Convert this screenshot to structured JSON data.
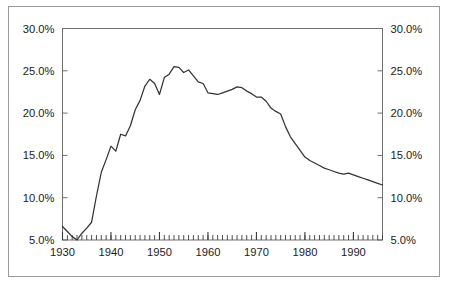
{
  "chart_data": {
    "type": "line",
    "title": "",
    "subtitle": "",
    "xlabel": "",
    "ylabel": "",
    "xlim": [
      1930,
      1996
    ],
    "ylim": [
      5.0,
      30.0
    ],
    "grid": false,
    "legend": null,
    "legend_position": "none",
    "y_tick_labels": [
      "30.0%",
      "25.0%",
      "20.0%",
      "15.0%",
      "10.0%",
      "5.0%"
    ],
    "y_tick_values": [
      30.0,
      25.0,
      20.0,
      15.0,
      10.0,
      5.0
    ],
    "y_axis_right_tick_labels": [
      "30.0%",
      "25.0%",
      "20.0%",
      "15.0%",
      "10.0%",
      "5.0%"
    ],
    "x_tick_labels": [
      "1930",
      "1940",
      "1950",
      "1960",
      "1970",
      "1980",
      "1990"
    ],
    "x_tick_values": [
      1930,
      1940,
      1950,
      1960,
      1970,
      1980,
      1990
    ],
    "x_minor_tick_interval": 1,
    "line_color": "#333333",
    "frame_color": "#9a9a9a",
    "background_color": "#ffffff",
    "series": [
      {
        "name": "value",
        "x": [
          1930,
          1931,
          1932,
          1933,
          1934,
          1935,
          1936,
          1937,
          1938,
          1939,
          1940,
          1941,
          1942,
          1943,
          1944,
          1945,
          1946,
          1947,
          1948,
          1949,
          1950,
          1951,
          1952,
          1953,
          1954,
          1955,
          1956,
          1957,
          1958,
          1959,
          1960,
          1961,
          1962,
          1963,
          1964,
          1965,
          1966,
          1967,
          1968,
          1969,
          1970,
          1971,
          1972,
          1973,
          1974,
          1975,
          1976,
          1977,
          1978,
          1979,
          1980,
          1981,
          1982,
          1983,
          1984,
          1985,
          1986,
          1987,
          1988,
          1989,
          1990,
          1991,
          1992,
          1993,
          1994,
          1995,
          1996
        ],
        "values": [
          6.6,
          6.0,
          5.4,
          5.0,
          5.8,
          6.4,
          7.1,
          10.2,
          13.0,
          14.5,
          16.1,
          15.5,
          17.5,
          17.3,
          18.5,
          20.4,
          21.5,
          23.2,
          24.0,
          23.5,
          22.2,
          24.2,
          24.6,
          25.5,
          25.4,
          24.8,
          25.1,
          24.4,
          23.7,
          23.5,
          22.4,
          22.3,
          22.2,
          22.4,
          22.6,
          22.8,
          23.1,
          23.0,
          22.6,
          22.3,
          21.9,
          21.9,
          21.4,
          20.6,
          20.2,
          19.9,
          18.4,
          17.2,
          16.4,
          15.6,
          14.8,
          14.4,
          14.1,
          13.8,
          13.5,
          13.3,
          13.1,
          12.9,
          12.8,
          12.9,
          12.7,
          12.5,
          12.3,
          12.1,
          11.9,
          11.7,
          11.5
        ]
      }
    ]
  }
}
